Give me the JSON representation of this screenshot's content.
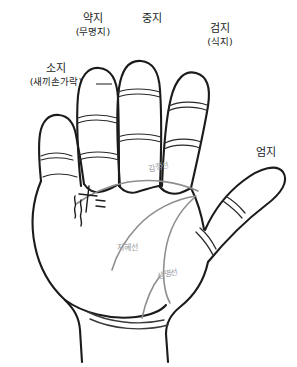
{
  "diagram": {
    "background_color": "#ffffff",
    "outline_color": "#1b1b1b",
    "palm_line_color": "#8d8d92",
    "label_color": "#1b1b1b",
    "palm_label_color": "#9a9a9f"
  },
  "fingers": [
    {
      "key": "pinky",
      "main": "소지",
      "sub": "(새끼손가락)"
    },
    {
      "key": "ring",
      "main": "약지",
      "sub": "(무명지)"
    },
    {
      "key": "middle",
      "main": "중지",
      "sub": ""
    },
    {
      "key": "index",
      "main": "검지",
      "sub": "(식지)"
    },
    {
      "key": "thumb",
      "main": "엄지",
      "sub": ""
    }
  ],
  "palm_lines": [
    {
      "key": "heart",
      "label": "감정선"
    },
    {
      "key": "head",
      "label": "지혜선"
    },
    {
      "key": "life",
      "label": "생명선"
    }
  ]
}
